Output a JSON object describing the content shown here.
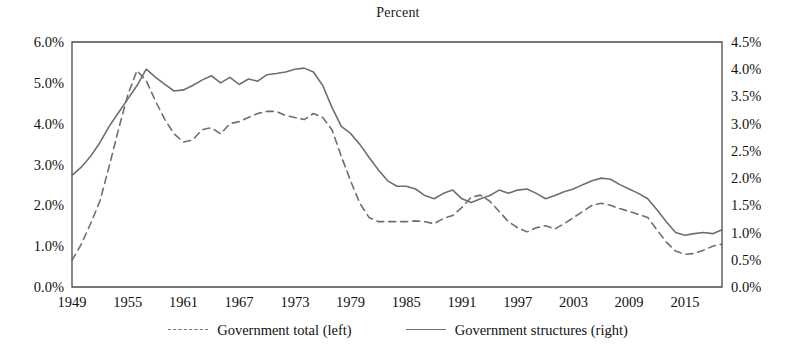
{
  "chart_data": {
    "type": "line",
    "title": "Percent",
    "xlabel": "",
    "ylabel": "Percent",
    "grid": false,
    "legend_position": "bottom-center",
    "xlim": [
      1949,
      2019
    ],
    "xticks": [
      "1949",
      "1955",
      "1961",
      "1967",
      "1973",
      "1979",
      "1985",
      "1991",
      "1997",
      "2003",
      "2009",
      "2015"
    ],
    "xtick_values": [
      1949,
      1955,
      1961,
      1967,
      1973,
      1979,
      1985,
      1991,
      1997,
      2003,
      2009,
      2015
    ],
    "axes": {
      "left": {
        "label": "Percent",
        "ylim": [
          0.0,
          6.0
        ],
        "ticks": [
          "0.0%",
          "1.0%",
          "2.0%",
          "3.0%",
          "4.0%",
          "5.0%",
          "6.0%"
        ],
        "tick_values": [
          0.0,
          1.0,
          2.0,
          3.0,
          4.0,
          5.0,
          6.0
        ]
      },
      "right": {
        "label": "Percent",
        "ylim": [
          0.0,
          4.5
        ],
        "ticks": [
          "0.0%",
          "0.5%",
          "1.0%",
          "1.5%",
          "2.0%",
          "2.5%",
          "3.0%",
          "3.5%",
          "4.0%",
          "4.5%"
        ],
        "tick_values": [
          0.0,
          0.5,
          1.0,
          1.5,
          2.0,
          2.5,
          3.0,
          3.5,
          4.0,
          4.5
        ]
      }
    },
    "x": [
      1949,
      1950,
      1951,
      1952,
      1953,
      1954,
      1955,
      1956,
      1957,
      1958,
      1959,
      1960,
      1961,
      1962,
      1963,
      1964,
      1965,
      1966,
      1967,
      1968,
      1969,
      1970,
      1971,
      1972,
      1973,
      1974,
      1975,
      1976,
      1977,
      1978,
      1979,
      1980,
      1981,
      1982,
      1983,
      1984,
      1985,
      1986,
      1987,
      1988,
      1989,
      1990,
      1991,
      1992,
      1993,
      1994,
      1995,
      1996,
      1997,
      1998,
      1999,
      2000,
      2001,
      2002,
      2003,
      2004,
      2005,
      2006,
      2007,
      2008,
      2009,
      2010,
      2011,
      2012,
      2013,
      2014,
      2015,
      2016,
      2017,
      2018,
      2019
    ],
    "series": [
      {
        "name": "Government total (left)",
        "axis": "left",
        "style": "dashed",
        "color": "#6f6f6f",
        "unit": "%",
        "values": [
          0.65,
          1.05,
          1.55,
          2.1,
          2.95,
          3.85,
          4.7,
          5.3,
          5.05,
          4.55,
          4.1,
          3.75,
          3.55,
          3.6,
          3.85,
          3.9,
          3.75,
          4.0,
          4.05,
          4.15,
          4.25,
          4.3,
          4.3,
          4.2,
          4.15,
          4.1,
          4.25,
          4.15,
          3.85,
          3.2,
          2.6,
          2.05,
          1.7,
          1.6,
          1.6,
          1.6,
          1.6,
          1.62,
          1.6,
          1.55,
          1.68,
          1.75,
          1.95,
          2.2,
          2.25,
          2.1,
          1.85,
          1.6,
          1.45,
          1.35,
          1.45,
          1.5,
          1.42,
          1.55,
          1.7,
          1.85,
          2.0,
          2.05,
          2.0,
          1.92,
          1.85,
          1.78,
          1.7,
          1.4,
          1.1,
          0.88,
          0.8,
          0.82,
          0.9,
          1.0,
          1.05
        ]
      },
      {
        "name": "Government structures (right)",
        "axis": "right",
        "style": "solid",
        "color": "#6f6f6f",
        "unit": "%",
        "values": [
          2.05,
          2.2,
          2.4,
          2.65,
          2.95,
          3.2,
          3.45,
          3.7,
          4.0,
          3.85,
          3.72,
          3.6,
          3.62,
          3.7,
          3.8,
          3.88,
          3.75,
          3.85,
          3.72,
          3.82,
          3.78,
          3.9,
          3.92,
          3.95,
          4.0,
          4.02,
          3.95,
          3.7,
          3.3,
          2.95,
          2.82,
          2.62,
          2.38,
          2.15,
          1.95,
          1.85,
          1.85,
          1.8,
          1.68,
          1.62,
          1.72,
          1.78,
          1.62,
          1.55,
          1.62,
          1.68,
          1.78,
          1.72,
          1.78,
          1.8,
          1.72,
          1.62,
          1.68,
          1.75,
          1.8,
          1.88,
          1.95,
          2.0,
          1.98,
          1.88,
          1.8,
          1.72,
          1.62,
          1.42,
          1.2,
          1.0,
          0.95,
          0.98,
          1.0,
          0.98,
          1.05
        ]
      }
    ]
  },
  "legend": {
    "entries": [
      {
        "label": "Government total (left)",
        "style": "dashed"
      },
      {
        "label": "Government structures (right)",
        "style": "solid"
      }
    ]
  }
}
